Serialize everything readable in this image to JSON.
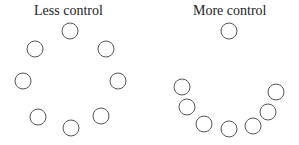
{
  "panels": [
    {
      "title": "Less control",
      "circles": [
        [
          70,
          31
        ],
        [
          35,
          49
        ],
        [
          106,
          49
        ],
        [
          23,
          81
        ],
        [
          118,
          81
        ],
        [
          38,
          117
        ],
        [
          101,
          116
        ],
        [
          71,
          128
        ]
      ]
    },
    {
      "title": "More control",
      "circles": [
        [
          229,
          31
        ],
        [
          182,
          87
        ],
        [
          187,
          107
        ],
        [
          204,
          124
        ],
        [
          229,
          129
        ],
        [
          253,
          126
        ],
        [
          268,
          112
        ],
        [
          276,
          92
        ]
      ]
    }
  ],
  "circle_radius": 8,
  "stroke_color": "#555555"
}
